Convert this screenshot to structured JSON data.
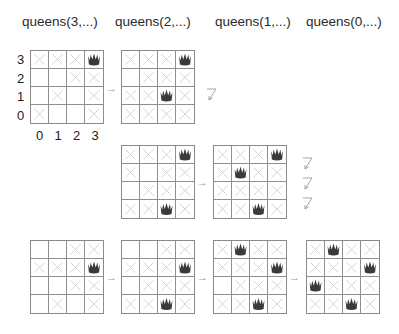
{
  "columns": [
    {
      "title": "queens(3,...)",
      "x": 22
    },
    {
      "title": "queens(2,...)",
      "x": 115
    },
    {
      "title": "queens(1,...)",
      "x": 215
    },
    {
      "title": "queens(0,...)",
      "x": 306
    }
  ],
  "rank_labels": [
    "3",
    "2",
    "1",
    "0"
  ],
  "file_labels": [
    "0",
    "1",
    "2",
    "3"
  ],
  "legend": {
    "Q": "queen",
    "X": "attacked",
    "_": "free"
  },
  "boards": [
    {
      "id": "b1",
      "x": 30,
      "y": 50,
      "rows": [
        "XXXQ",
        "__XX",
        "_X_X",
        "X__X"
      ]
    },
    {
      "id": "b2",
      "x": 121,
      "y": 50,
      "rows": [
        "XXXQ",
        "_XXX",
        "XXQX",
        "XXXX"
      ]
    },
    {
      "id": "b3",
      "x": 121,
      "y": 145,
      "rows": [
        "XXXQ",
        "X_XX",
        "_XXX",
        "XXQX"
      ]
    },
    {
      "id": "b4",
      "x": 213,
      "y": 145,
      "rows": [
        "XXXQ",
        "XQXX",
        "XXXX",
        "XXQX"
      ]
    },
    {
      "id": "b5",
      "x": 30,
      "y": 240,
      "rows": [
        "__XX",
        "XXXQ",
        "__XX",
        "_X_X"
      ]
    },
    {
      "id": "b6",
      "x": 121,
      "y": 240,
      "rows": [
        "__XX",
        "XXXQ",
        "_XXX",
        "XXQX"
      ]
    },
    {
      "id": "b7",
      "x": 213,
      "y": 240,
      "rows": [
        "XQXX",
        "XXXQ",
        "_XXX",
        "XXQX"
      ]
    },
    {
      "id": "b8",
      "x": 306,
      "y": 240,
      "rows": [
        "XQXX",
        "XXXQ",
        "QXXX",
        "XXQX"
      ]
    }
  ],
  "arrows": [
    {
      "x": 106,
      "y": 82,
      "glyph": "→"
    },
    {
      "x": 197,
      "y": 176,
      "glyph": "→"
    },
    {
      "x": 106,
      "y": 271,
      "glyph": "→"
    },
    {
      "x": 197,
      "y": 271,
      "glyph": "→"
    },
    {
      "x": 289,
      "y": 271,
      "glyph": "→"
    }
  ],
  "dead_ends": [
    {
      "x": 206,
      "y": 88
    },
    {
      "x": 302,
      "y": 157
    },
    {
      "x": 302,
      "y": 177
    },
    {
      "x": 302,
      "y": 197
    }
  ],
  "colors": {
    "queen": "#3a3a3a",
    "cross": "#cfcfcf",
    "grid": "#8f8f8f",
    "arrow": "#9a9a9a"
  }
}
